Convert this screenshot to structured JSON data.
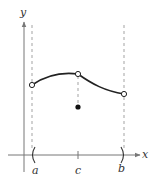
{
  "diagram": {
    "axes": {
      "x_label": "x",
      "y_label": "y"
    },
    "points": {
      "a": {
        "label": "a"
      },
      "c": {
        "label": "c"
      },
      "b": {
        "label": "b"
      }
    },
    "colors": {
      "curve": "#222222",
      "axis": "#777777",
      "dashed": "#999999",
      "point": "#111111"
    }
  }
}
